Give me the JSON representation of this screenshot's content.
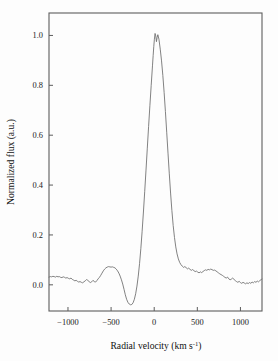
{
  "figure": {
    "background_color": "#fdfdfd",
    "line_color": "#6b6b6b",
    "axis_color": "#5d5d5d",
    "text_color": "#111111"
  },
  "chart_data": {
    "type": "line",
    "title": "",
    "xlabel": "Radial velocity (km s",
    "xlabel_sup": "-1",
    "xlabel_tail": ")",
    "xlabel_full": "Radial velocity (km s⁻¹)",
    "ylabel": "Normalized flux (a.u.)",
    "xlim": [
      -1220,
      1250
    ],
    "ylim": [
      -0.105,
      1.09
    ],
    "grid": false,
    "legend": "none",
    "xticks": [
      -1000,
      -500,
      0,
      500,
      1000
    ],
    "xtick_labels": [
      "−1000",
      "−500",
      "0",
      "500",
      "1000"
    ],
    "yticks": [
      0.0,
      0.2,
      0.4,
      0.6,
      0.8,
      1.0
    ],
    "ytick_labels": [
      "0.0",
      "0.2",
      "0.4",
      "0.6",
      "0.8",
      "1.0"
    ],
    "series": [
      {
        "name": "spectral-line-profile",
        "x": [
          -1220,
          -1205,
          -1190,
          -1175,
          -1160,
          -1145,
          -1130,
          -1115,
          -1100,
          -1085,
          -1070,
          -1055,
          -1040,
          -1025,
          -1010,
          -995,
          -980,
          -965,
          -950,
          -935,
          -920,
          -905,
          -890,
          -875,
          -860,
          -845,
          -830,
          -815,
          -800,
          -785,
          -770,
          -755,
          -740,
          -725,
          -710,
          -695,
          -680,
          -665,
          -650,
          -635,
          -620,
          -605,
          -590,
          -575,
          -560,
          -545,
          -530,
          -515,
          -500,
          -485,
          -470,
          -455,
          -440,
          -425,
          -410,
          -395,
          -380,
          -365,
          -350,
          -335,
          -320,
          -305,
          -290,
          -275,
          -260,
          -245,
          -230,
          -215,
          -200,
          -185,
          -170,
          -155,
          -140,
          -125,
          -110,
          -95,
          -80,
          -65,
          -50,
          -35,
          -20,
          -12,
          -5,
          2,
          10,
          18,
          26,
          34,
          42,
          55,
          70,
          85,
          100,
          115,
          130,
          145,
          160,
          175,
          190,
          205,
          220,
          235,
          250,
          265,
          280,
          295,
          310,
          325,
          340,
          355,
          370,
          385,
          400,
          415,
          430,
          445,
          460,
          475,
          490,
          505,
          520,
          535,
          550,
          565,
          580,
          595,
          610,
          625,
          640,
          655,
          670,
          685,
          700,
          715,
          730,
          745,
          760,
          775,
          790,
          805,
          820,
          835,
          850,
          865,
          880,
          895,
          910,
          925,
          940,
          955,
          970,
          985,
          1000,
          1015,
          1030,
          1045,
          1060,
          1075,
          1090,
          1105,
          1120,
          1135,
          1150,
          1165,
          1180,
          1195,
          1210,
          1225,
          1240,
          1250
        ],
        "y": [
          0.031,
          0.033,
          0.032,
          0.034,
          0.033,
          0.031,
          0.034,
          0.032,
          0.033,
          0.03,
          0.029,
          0.032,
          0.03,
          0.027,
          0.029,
          0.026,
          0.024,
          0.027,
          0.022,
          0.019,
          0.016,
          0.018,
          0.014,
          0.011,
          0.013,
          0.01,
          0.008,
          0.012,
          0.016,
          0.021,
          0.018,
          0.013,
          0.009,
          0.012,
          0.018,
          0.013,
          0.011,
          0.017,
          0.024,
          0.03,
          0.038,
          0.047,
          0.056,
          0.063,
          0.068,
          0.071,
          0.073,
          0.072,
          0.071,
          0.072,
          0.07,
          0.068,
          0.063,
          0.056,
          0.047,
          0.035,
          0.02,
          0.003,
          -0.018,
          -0.04,
          -0.058,
          -0.07,
          -0.077,
          -0.08,
          -0.079,
          -0.072,
          -0.058,
          -0.036,
          -0.005,
          0.035,
          0.085,
          0.145,
          0.215,
          0.292,
          0.375,
          0.46,
          0.548,
          0.635,
          0.718,
          0.8,
          0.878,
          0.92,
          0.955,
          0.985,
          1.008,
          0.998,
          0.975,
          0.992,
          1.003,
          0.985,
          0.945,
          0.898,
          0.84,
          0.772,
          0.695,
          0.612,
          0.528,
          0.445,
          0.368,
          0.298,
          0.238,
          0.19,
          0.152,
          0.124,
          0.104,
          0.09,
          0.081,
          0.075,
          0.07,
          0.073,
          0.069,
          0.064,
          0.067,
          0.062,
          0.058,
          0.061,
          0.057,
          0.053,
          0.055,
          0.051,
          0.048,
          0.052,
          0.049,
          0.053,
          0.057,
          0.06,
          0.058,
          0.062,
          0.06,
          0.063,
          0.061,
          0.058,
          0.059,
          0.056,
          0.052,
          0.048,
          0.044,
          0.041,
          0.038,
          0.034,
          0.03,
          0.027,
          0.031,
          0.024,
          0.02,
          0.023,
          0.027,
          0.022,
          0.017,
          0.013,
          0.01,
          0.014,
          0.009,
          0.006,
          0.01,
          0.007,
          0.004,
          0.008,
          0.005,
          0.009,
          0.006,
          0.011,
          0.008,
          0.013,
          0.01,
          0.015,
          0.012,
          0.017,
          0.021,
          0.023
        ]
      }
    ],
    "annotations": [
      {
        "name": "emission-peak",
        "x": 0,
        "y": 1.01,
        "note": "narrow emission peak with double-bump apex"
      },
      {
        "name": "absorption-dip",
        "x": -330,
        "y": -0.08,
        "note": "blueshifted absorption trough"
      },
      {
        "name": "blue-shoulder-bump",
        "x": -600,
        "y": 0.072,
        "note": "broad blue-side bump"
      },
      {
        "name": "red-plateau",
        "x": 620,
        "y": 0.061,
        "note": "noisy red-side plateau"
      }
    ]
  }
}
